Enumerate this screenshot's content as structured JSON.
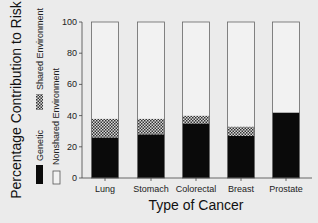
{
  "chart_data": {
    "type": "bar",
    "stacked": true,
    "title": "",
    "xlabel": "Type of Cancer",
    "ylabel": "Percentage Contribution to Risk",
    "ylim": [
      0,
      100
    ],
    "yticks": [
      0,
      20,
      40,
      60,
      80,
      100
    ],
    "categories": [
      "Lung",
      "Stomach",
      "Colorectal",
      "Breast",
      "Prostate"
    ],
    "series": [
      {
        "name": "Genetic",
        "values": [
          26,
          28,
          35,
          27,
          42
        ],
        "fill": "solid-black"
      },
      {
        "name": "Shared Environment",
        "values": [
          12,
          10,
          5,
          6,
          0
        ],
        "fill": "checkered"
      },
      {
        "name": "Nonshared Environment",
        "values": [
          62,
          62,
          60,
          67,
          58
        ],
        "fill": "white"
      }
    ],
    "legend": {
      "placement": "left-vertical",
      "entries": [
        "Genetic",
        "Shared Environment",
        "Nonshared Environment"
      ]
    },
    "grid": false
  },
  "colors": {
    "genetic": "#0a0a0a",
    "nonshared": "#f2f2f2",
    "outline": "#555555",
    "background": "#ebebeb"
  }
}
